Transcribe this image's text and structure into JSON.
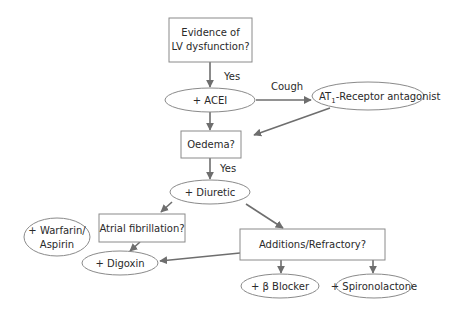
{
  "diagram": {
    "type": "flowchart",
    "nodes": {
      "lv_dysfunction": {
        "shape": "box",
        "line1": "Evidence of",
        "line2": "LV dysfunction?"
      },
      "acei": {
        "shape": "ellipse",
        "label": "+ ACEI"
      },
      "at1": {
        "shape": "ellipse",
        "prefix": "AT",
        "subscript": "1",
        "suffix": "-Receptor antagonist"
      },
      "oedema": {
        "shape": "box",
        "label": "Oedema?"
      },
      "diuretic": {
        "shape": "ellipse",
        "label": "+ Diuretic"
      },
      "atrial_fib": {
        "shape": "box",
        "label": "Atrial fibrillation?"
      },
      "warfarin": {
        "shape": "ellipse",
        "line1": "+ Warfarin/",
        "line2": "Aspirin"
      },
      "digoxin": {
        "shape": "ellipse",
        "label": "+ Digoxin"
      },
      "additions": {
        "shape": "box",
        "label": "Additions/Refractory?"
      },
      "beta_blocker": {
        "shape": "ellipse",
        "label": "+ β Blocker"
      },
      "spironolactone": {
        "shape": "ellipse",
        "label": "+ Spironolactone"
      }
    },
    "edge_labels": {
      "yes1": "Yes",
      "cough": "Cough",
      "yes2": "Yes"
    },
    "edges": [
      {
        "from": "lv_dysfunction",
        "to": "acei",
        "label": "Yes"
      },
      {
        "from": "acei",
        "to": "at1",
        "label": "Cough"
      },
      {
        "from": "acei",
        "to": "oedema"
      },
      {
        "from": "at1",
        "to": "oedema"
      },
      {
        "from": "oedema",
        "to": "diuretic",
        "label": "Yes"
      },
      {
        "from": "diuretic",
        "to": "atrial_fib"
      },
      {
        "from": "diuretic",
        "to": "additions"
      },
      {
        "from": "atrial_fib",
        "to": "digoxin"
      },
      {
        "from": "additions",
        "to": "digoxin"
      },
      {
        "from": "additions",
        "to": "beta_blocker"
      },
      {
        "from": "additions",
        "to": "spironolactone"
      }
    ],
    "colors": {
      "line": "#6e6e6e",
      "border": "#8a8a8a",
      "text": "#2a2a2a",
      "background": "#ffffff"
    }
  }
}
